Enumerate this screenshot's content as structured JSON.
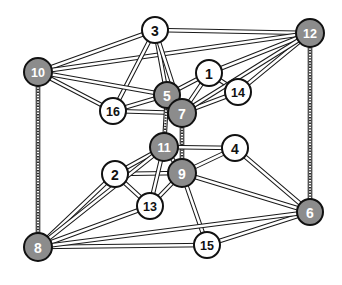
{
  "diagram": {
    "width": 342,
    "height": 285,
    "background": "#ffffff",
    "style": {
      "edge_stroke": "#1a1a1a",
      "edge_fill": "#ffffff",
      "node_dark_fill": "#8c8c8c",
      "node_light_fill": "#ffffff",
      "node_stroke": "#111111",
      "label_dark_color": "#ffffff",
      "label_light_color": "#111111",
      "node_radius": 13,
      "edge_width": 4.6
    },
    "nodes": [
      {
        "id": 1,
        "label": "1",
        "x": 209,
        "y": 73,
        "shade": "light",
        "r": 13
      },
      {
        "id": 2,
        "label": "2",
        "x": 115,
        "y": 174,
        "shade": "light",
        "r": 13
      },
      {
        "id": 3,
        "label": "3",
        "x": 155,
        "y": 30,
        "shade": "light",
        "r": 13
      },
      {
        "id": 4,
        "label": "4",
        "x": 235,
        "y": 148,
        "shade": "light",
        "r": 13
      },
      {
        "id": 5,
        "label": "5",
        "x": 167,
        "y": 95,
        "shade": "dark",
        "r": 13
      },
      {
        "id": 6,
        "label": "6",
        "x": 310,
        "y": 212,
        "shade": "dark",
        "r": 13
      },
      {
        "id": 7,
        "label": "7",
        "x": 182,
        "y": 113,
        "shade": "dark",
        "r": 14
      },
      {
        "id": 8,
        "label": "8",
        "x": 38,
        "y": 247,
        "shade": "dark",
        "r": 14
      },
      {
        "id": 9,
        "label": "9",
        "x": 182,
        "y": 173,
        "shade": "dark",
        "r": 14
      },
      {
        "id": 10,
        "label": "10",
        "x": 38,
        "y": 72,
        "shade": "dark",
        "r": 14
      },
      {
        "id": 11,
        "label": "11",
        "x": 164,
        "y": 147,
        "shade": "dark",
        "r": 14
      },
      {
        "id": 12,
        "label": "12",
        "x": 310,
        "y": 33,
        "shade": "dark",
        "r": 14
      },
      {
        "id": 13,
        "label": "13",
        "x": 150,
        "y": 206,
        "shade": "light",
        "r": 13
      },
      {
        "id": 14,
        "label": "14",
        "x": 238,
        "y": 92,
        "shade": "light",
        "r": 13
      },
      {
        "id": 15,
        "label": "15",
        "x": 207,
        "y": 245,
        "shade": "light",
        "r": 13
      },
      {
        "id": 16,
        "label": "16",
        "x": 113,
        "y": 111,
        "shade": "light",
        "r": 13
      }
    ],
    "edges": [
      {
        "from": 10,
        "to": 3,
        "style": "solid"
      },
      {
        "from": 3,
        "to": 12,
        "style": "solid"
      },
      {
        "from": 10,
        "to": 12,
        "style": "solid"
      },
      {
        "from": 10,
        "to": 16,
        "style": "solid"
      },
      {
        "from": 16,
        "to": 3,
        "style": "solid"
      },
      {
        "from": 3,
        "to": 5,
        "style": "solid"
      },
      {
        "from": 3,
        "to": 7,
        "style": "solid"
      },
      {
        "from": 10,
        "to": 5,
        "style": "solid"
      },
      {
        "from": 16,
        "to": 5,
        "style": "solid"
      },
      {
        "from": 16,
        "to": 7,
        "style": "solid"
      },
      {
        "from": 5,
        "to": 1,
        "style": "solid"
      },
      {
        "from": 7,
        "to": 1,
        "style": "solid"
      },
      {
        "from": 5,
        "to": 7,
        "style": "solid"
      },
      {
        "from": 1,
        "to": 12,
        "style": "solid"
      },
      {
        "from": 1,
        "to": 14,
        "style": "solid"
      },
      {
        "from": 14,
        "to": 12,
        "style": "solid"
      },
      {
        "from": 7,
        "to": 14,
        "style": "solid"
      },
      {
        "from": 7,
        "to": 12,
        "style": "solid"
      },
      {
        "from": 5,
        "to": 11,
        "style": "dotted"
      },
      {
        "from": 7,
        "to": 9,
        "style": "dotted"
      },
      {
        "from": 10,
        "to": 8,
        "style": "dotted"
      },
      {
        "from": 12,
        "to": 6,
        "style": "dotted"
      },
      {
        "from": 11,
        "to": 2,
        "style": "solid"
      },
      {
        "from": 11,
        "to": 9,
        "style": "solid"
      },
      {
        "from": 2,
        "to": 9,
        "style": "solid"
      },
      {
        "from": 11,
        "to": 4,
        "style": "solid"
      },
      {
        "from": 9,
        "to": 4,
        "style": "solid"
      },
      {
        "from": 11,
        "to": 13,
        "style": "solid"
      },
      {
        "from": 2,
        "to": 13,
        "style": "solid"
      },
      {
        "from": 9,
        "to": 13,
        "style": "solid"
      },
      {
        "from": 4,
        "to": 6,
        "style": "solid"
      },
      {
        "from": 9,
        "to": 6,
        "style": "solid"
      },
      {
        "from": 2,
        "to": 8,
        "style": "solid"
      },
      {
        "from": 13,
        "to": 8,
        "style": "solid"
      },
      {
        "from": 11,
        "to": 8,
        "style": "solid"
      },
      {
        "from": 9,
        "to": 15,
        "style": "solid"
      },
      {
        "from": 8,
        "to": 15,
        "style": "solid"
      },
      {
        "from": 15,
        "to": 6,
        "style": "solid"
      },
      {
        "from": 8,
        "to": 6,
        "style": "solid"
      }
    ]
  }
}
